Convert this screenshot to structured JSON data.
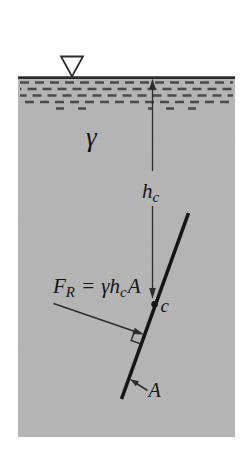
{
  "colors": {
    "background": "#ffffff",
    "fluid": "#b6b6b6",
    "dashes": "#4a4a4a",
    "line": "#2c2c2c",
    "plane": "#151515",
    "text": "#151515",
    "surface_marker_fill": "#ffffff"
  },
  "labels": {
    "specific_weight": "γ",
    "depth": {
      "base": "h",
      "sub": "c"
    },
    "force": {
      "symbol": "F",
      "symbol_sub": "R",
      "equals": "=",
      "expr": "γh",
      "expr_sub": "c",
      "area": "A"
    },
    "centroid": "c",
    "area": "A"
  }
}
